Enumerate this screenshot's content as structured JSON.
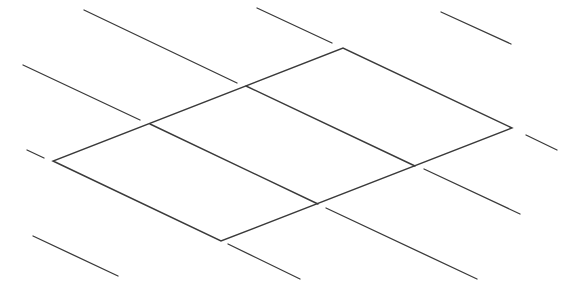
{
  "diagram": {
    "type": "parallelogram-grid-with-extension-lines",
    "stroke_color": "#3a3a3a",
    "background_color": "#ffffff",
    "outline": {
      "vertices": [
        [
          53,
          161
        ],
        [
          221,
          241
        ],
        [
          512,
          128
        ],
        [
          343,
          48
        ]
      ]
    },
    "dividers": [
      {
        "x1": 150,
        "y1": 124,
        "x2": 318,
        "y2": 204
      },
      {
        "x1": 246,
        "y1": 86,
        "x2": 415,
        "y2": 166
      }
    ],
    "extensions": [
      {
        "x1": 84,
        "y1": 10,
        "x2": 237,
        "y2": 83
      },
      {
        "x1": 23,
        "y1": 65,
        "x2": 140,
        "y2": 120
      },
      {
        "x1": 27,
        "y1": 150,
        "x2": 44,
        "y2": 158
      },
      {
        "x1": 33,
        "y1": 236,
        "x2": 118,
        "y2": 276
      },
      {
        "x1": 257,
        "y1": 8,
        "x2": 332,
        "y2": 43
      },
      {
        "x1": 441,
        "y1": 12,
        "x2": 511,
        "y2": 44
      },
      {
        "x1": 526,
        "y1": 135,
        "x2": 557,
        "y2": 150
      },
      {
        "x1": 424,
        "y1": 169,
        "x2": 520,
        "y2": 214
      },
      {
        "x1": 326,
        "y1": 208,
        "x2": 477,
        "y2": 279
      },
      {
        "x1": 228,
        "y1": 244,
        "x2": 300,
        "y2": 279
      }
    ]
  }
}
